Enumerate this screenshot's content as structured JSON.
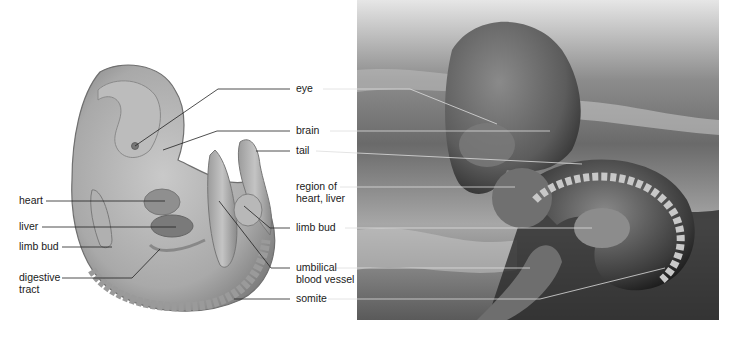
{
  "figure": {
    "left_panel": {
      "description": "illustration of vertebrate embryo",
      "fill_color": "#a6a6a6",
      "labels": [
        {
          "id": "heart",
          "text": "heart"
        },
        {
          "id": "liver",
          "text": "liver"
        },
        {
          "id": "limb_bud_left",
          "text": "limb bud"
        },
        {
          "id": "digestive_tract",
          "text": "digestive\ntract"
        }
      ]
    },
    "center_labels": [
      {
        "id": "eye",
        "text": "eye"
      },
      {
        "id": "brain",
        "text": "brain"
      },
      {
        "id": "tail",
        "text": "tail"
      },
      {
        "id": "region_heart_liver",
        "text": "region of\nheart, liver"
      },
      {
        "id": "limb_bud",
        "text": "limb bud"
      },
      {
        "id": "umbilical_blood_vessel",
        "text": "umbilical\nblood vessel"
      },
      {
        "id": "somite",
        "text": "somite"
      }
    ],
    "right_panel": {
      "description": "scanning electron micrograph of embryo",
      "tone": "grayscale"
    }
  }
}
